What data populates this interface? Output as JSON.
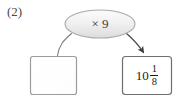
{
  "problem": {
    "number_label": "(2)"
  },
  "diagram": {
    "operator_bubble": {
      "label": "× 9",
      "shape": "ellipse",
      "fill_color": "#f2f2f2",
      "stroke_color": "#a8a8a8"
    },
    "boxes": [
      {
        "name": "input-box",
        "value": "",
        "fill_color": "#ffffff",
        "stroke_color": "#9a9a9a"
      },
      {
        "name": "output-box",
        "whole": "10",
        "numerator": "1",
        "denominator": "8",
        "value": "10 1/8",
        "fill_color": "#ffffff",
        "stroke_color": "#6e6e6e"
      }
    ],
    "connectors": [
      {
        "name": "left-connector",
        "from": "operator-bubble",
        "to": "input-box",
        "arrowhead": false,
        "stroke_color": "#7a7a7a"
      },
      {
        "name": "right-connector",
        "from": "operator-bubble",
        "to": "output-box",
        "arrowhead": true,
        "stroke_color": "#4a4a4a"
      }
    ]
  }
}
